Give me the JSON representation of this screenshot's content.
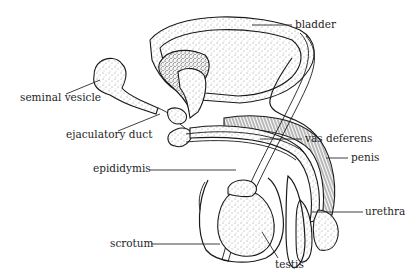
{
  "diagram": {
    "labels": {
      "bladder": "bladder",
      "seminal_vesicle": "seminal vesicle",
      "ejaculatory_duct": "ejaculatory duct",
      "vas_deferens": "vas deferens",
      "penis": "penis",
      "epididymis": "epididymis",
      "urethra": "urethra",
      "scrotum": "scrotum",
      "testis": "testis"
    }
  }
}
